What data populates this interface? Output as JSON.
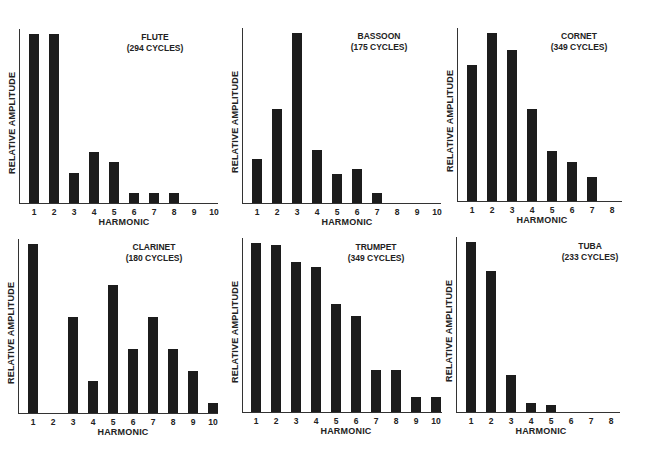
{
  "chart_data": [
    {
      "type": "bar",
      "title": "FLUTE",
      "subtitle": "(294 CYCLES)",
      "xlabel": "HARMONIC",
      "ylabel": "RELATIVE AMPLITUDE",
      "categories": [
        "1",
        "2",
        "3",
        "4",
        "5",
        "6",
        "7",
        "8",
        "9",
        "10"
      ],
      "values": [
        100,
        100,
        18,
        30,
        24,
        6,
        6,
        6,
        0,
        0
      ],
      "ylim": [
        0,
        100
      ],
      "grid": false
    },
    {
      "type": "bar",
      "title": "BASSOON",
      "subtitle": "(175 CYCLES)",
      "xlabel": "HARMONIC",
      "ylabel": "RELATIVE AMPLITUDE",
      "categories": [
        "1",
        "2",
        "3",
        "4",
        "5",
        "6",
        "7",
        "8",
        "9",
        "10"
      ],
      "values": [
        26,
        55,
        100,
        31,
        17,
        20,
        6,
        0,
        0,
        0
      ],
      "ylim": [
        0,
        100
      ],
      "grid": false
    },
    {
      "type": "bar",
      "title": "CORNET",
      "subtitle": "(349 CYCLES)",
      "xlabel": "HARMONIC",
      "ylabel": "RELATIVE AMPLITUDE",
      "categories": [
        "1",
        "2",
        "3",
        "4",
        "5",
        "6",
        "7",
        "8"
      ],
      "values": [
        81,
        100,
        90,
        55,
        30,
        23,
        14,
        0
      ],
      "ylim": [
        0,
        100
      ],
      "grid": false
    },
    {
      "type": "bar",
      "title": "CLARINET",
      "subtitle": "(180 CYCLES)",
      "xlabel": "HARMONIC",
      "ylabel": "RELATIVE AMPLITUDE",
      "categories": [
        "1",
        "2",
        "3",
        "4",
        "5",
        "6",
        "7",
        "8",
        "9",
        "10"
      ],
      "values": [
        100,
        0,
        57,
        19,
        76,
        38,
        57,
        38,
        25,
        6
      ],
      "ylim": [
        0,
        100
      ],
      "grid": false
    },
    {
      "type": "bar",
      "title": "TRUMPET",
      "subtitle": "(349 CYCLES)",
      "xlabel": "HARMONIC",
      "ylabel": "RELATIVE AMPLITUDE",
      "categories": [
        "1",
        "2",
        "3",
        "4",
        "5",
        "6",
        "7",
        "8",
        "9",
        "10"
      ],
      "values": [
        100,
        99,
        89,
        86,
        64,
        57,
        25,
        25,
        9,
        9
      ],
      "ylim": [
        0,
        100
      ],
      "grid": false
    },
    {
      "type": "bar",
      "title": "TUBA",
      "subtitle": "(233 CYCLES)",
      "xlabel": "HARMONIC",
      "ylabel": "RELATIVE AMPLITUDE",
      "categories": [
        "1",
        "2",
        "3",
        "4",
        "5",
        "6",
        "7",
        "8"
      ],
      "values": [
        100,
        83,
        22,
        5,
        4,
        0,
        0,
        0
      ],
      "ylim": [
        0,
        100
      ],
      "grid": false
    }
  ],
  "colors": {
    "bar": "#1c1c1c",
    "axis": "#333333",
    "background": "#ffffff"
  }
}
